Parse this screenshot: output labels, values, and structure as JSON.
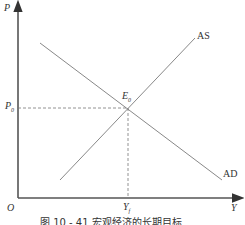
{
  "diagram": {
    "axes": {
      "y_label": "P",
      "x_label": "Y",
      "origin_label": "O"
    },
    "curves": [
      {
        "name": "AS",
        "label": "AS",
        "from": [
          60,
          180
        ],
        "to": [
          195,
          38
        ]
      },
      {
        "name": "AD",
        "label": "AD",
        "from": [
          40,
          43
        ],
        "to": [
          222,
          180
        ]
      }
    ],
    "equilibrium": {
      "label": "E",
      "sub": "0",
      "price_label": "P",
      "price_sub": "0",
      "output_label": "Y",
      "output_sub": "f"
    },
    "caption": "图 10 - 41   宏观经济的长期目标"
  },
  "colors": {
    "axis": "#555555",
    "curve": "#888888",
    "text": "#333333"
  }
}
